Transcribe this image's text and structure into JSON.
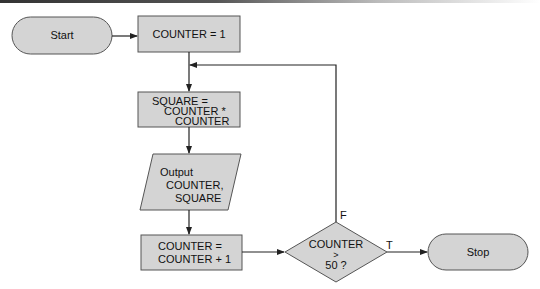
{
  "flowchart": {
    "colors": {
      "fill": "#d4d4d4",
      "stroke": "#555555",
      "line": "#222222"
    },
    "nodes": {
      "start": {
        "type": "terminator",
        "label": "Start"
      },
      "init": {
        "type": "process",
        "label": "COUNTER = 1"
      },
      "square": {
        "type": "process",
        "line1": "SQUARE =",
        "line2": "COUNTER *",
        "line3": "COUNTER"
      },
      "output": {
        "type": "io",
        "line1": "Output",
        "line2": "COUNTER,",
        "line3": "SQUARE"
      },
      "increment": {
        "type": "process",
        "line1": "COUNTER =",
        "line2": "COUNTER + 1"
      },
      "decision": {
        "type": "decision",
        "line1": "COUNTER",
        "line2": ">",
        "line3": "50 ?"
      },
      "stop": {
        "type": "terminator",
        "label": "Stop"
      }
    },
    "edges": {
      "false_label": "F",
      "true_label": "T"
    }
  }
}
